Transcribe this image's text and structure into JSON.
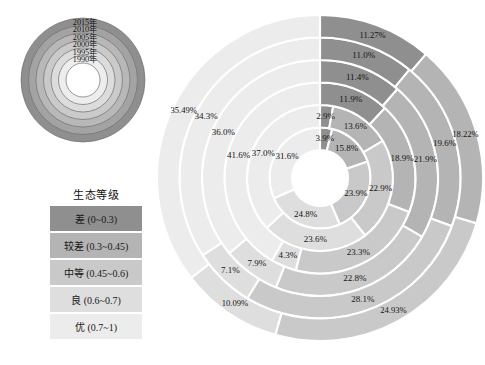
{
  "colors": {
    "cha": "#8f8f8f",
    "jiaocha": "#b4b4b4",
    "zhongdeng": "#c9c9c9",
    "liang": "#dedede",
    "you": "#ececec",
    "stroke": "#ffffff",
    "text": "#141414"
  },
  "year_key": {
    "name": "year-ring-key",
    "rings": [
      {
        "year": "2015年",
        "color": "#8f8f8f"
      },
      {
        "year": "2010年",
        "color": "#a3a3a3"
      },
      {
        "year": "2005年",
        "color": "#b8b8b8"
      },
      {
        "year": "2000年",
        "color": "#cacaca"
      },
      {
        "year": "1995年",
        "color": "#dcdcdc"
      },
      {
        "year": "1990年",
        "color": "#ededed"
      }
    ]
  },
  "legend": {
    "title": "生态等级",
    "items": [
      {
        "label": "差 (0~0.3)",
        "color": "#8f8f8f"
      },
      {
        "label": "较差 (0.3~0.45)",
        "color": "#b4b4b4"
      },
      {
        "label": "中等 (0.45~0.6)",
        "color": "#c9c9c9"
      },
      {
        "label": "良 (0.6~0.7)",
        "color": "#dedede"
      },
      {
        "label": "优 (0.7~1)",
        "color": "#ececec"
      }
    ]
  },
  "chart_data": {
    "type": "pie",
    "subtype": "sunburst-multiring-donut",
    "title": "",
    "legend_title": "生态等级",
    "categories": [
      "差 (0~0.3)",
      "较差 (0.3~0.45)",
      "中等 (0.45~0.6)",
      "良 (0.6~0.7)",
      "优 (0.7~1)"
    ],
    "category_colors": [
      "#8f8f8f",
      "#b4b4b4",
      "#c9c9c9",
      "#dedede",
      "#ececec"
    ],
    "ring_order_inner_to_outer": [
      "1990年",
      "1995年",
      "2000年",
      "2005年",
      "2010年",
      "2015年"
    ],
    "units": "percent",
    "start_angle_deg": 0,
    "direction": "clockwise",
    "rings": [
      {
        "year": "1990年",
        "values": [
          3.9,
          15.8,
          23.9,
          24.8,
          31.6
        ],
        "labels": [
          "3.9%",
          "15.8%",
          "23.9%",
          "24.8%",
          "31.6%"
        ]
      },
      {
        "year": "1995年",
        "values": [
          2.9,
          13.6,
          22.9,
          23.6,
          37.0
        ],
        "labels": [
          "2.9%",
          "13.6%",
          "22.9%",
          "23.6%",
          "37.0%"
        ]
      },
      {
        "year": "2000年",
        "values": [
          11.9,
          18.9,
          23.3,
          4.3,
          41.6
        ],
        "labels": [
          "11.9%",
          "18.9%",
          "23.3%",
          "4.3%",
          "41.6%"
        ]
      },
      {
        "year": "2005年",
        "values": [
          11.4,
          21.9,
          22.8,
          7.9,
          36.0
        ],
        "labels": [
          "11.4%",
          "21.9%",
          "22.8%",
          "7.9%",
          "36.0%"
        ]
      },
      {
        "year": "2010年",
        "values": [
          11.0,
          19.6,
          28.1,
          7.1,
          34.3
        ],
        "labels": [
          "11.0%",
          "19.6%",
          "28.1%",
          "7.1%",
          "34.3%"
        ]
      },
      {
        "year": "2015年",
        "values": [
          11.27,
          18.22,
          24.93,
          10.09,
          35.49
        ],
        "labels": [
          "11.27%",
          "18.22%",
          "24.93%",
          "10.09%",
          "35.49%"
        ]
      }
    ]
  }
}
